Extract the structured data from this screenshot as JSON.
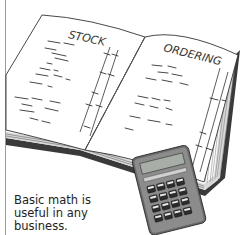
{
  "illustration": {
    "subject": "open ledger book with calculator",
    "left_page_heading": "STOCK",
    "right_page_heading": "ORDERING",
    "colors": {
      "page": "#ffffff",
      "ink": "#2a2a2a",
      "page_edge": "#8a8a8a",
      "cover": "#3a3a3a",
      "calculator_body": "#5a5a5a",
      "calculator_keys": "#2b2b2b",
      "display": "#9aa39a"
    }
  },
  "caption": {
    "lines": [
      "Basic math is",
      "useful in any",
      "business."
    ]
  }
}
